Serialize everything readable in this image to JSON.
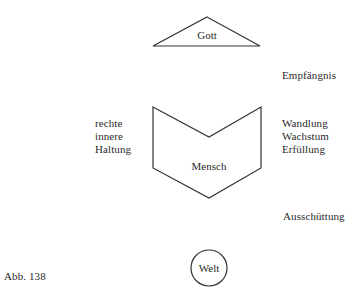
{
  "diagram": {
    "nodes": {
      "gott": {
        "label": "Gott",
        "shape": "triangle"
      },
      "mensch": {
        "label": "Mensch",
        "shape": "chevron-pentagon"
      },
      "welt": {
        "label": "Welt",
        "shape": "circle"
      }
    },
    "annotations": {
      "empfaengnis": "Empfängnis",
      "left_lines": [
        "rechte",
        "innere",
        "Haltung"
      ],
      "right_lines": [
        "Wandlung",
        "Wachstum",
        "Erfüllung"
      ],
      "ausschuettung": "Ausschüttung"
    },
    "caption": "Abb. 138",
    "stroke_color": "#333333"
  }
}
